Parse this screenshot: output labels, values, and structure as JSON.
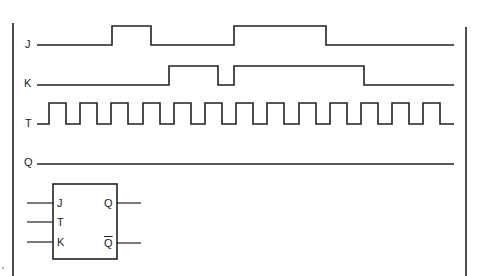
{
  "diagram": {
    "title": "",
    "colors": {
      "stroke": "#222222",
      "background": "#ffffff"
    },
    "signals": [
      {
        "name": "J",
        "label": "J",
        "label_y": 44
      },
      {
        "name": "K",
        "label": "K",
        "label_y": 83
      },
      {
        "name": "T",
        "label": "T",
        "label_y": 123
      },
      {
        "name": "Q",
        "label": "Q",
        "label_y": 162
      }
    ],
    "waveforms": {
      "J": {
        "low_y": 45,
        "high_y": 26,
        "pulses": [
          [
            112,
            151
          ],
          [
            234,
            326
          ]
        ],
        "x_start": 37,
        "x_end": 454
      },
      "K": {
        "low_y": 85,
        "high_y": 66,
        "pulses": [
          [
            169,
            218
          ],
          [
            234,
            364
          ]
        ],
        "x_start": 37,
        "x_end": 454
      },
      "T": {
        "low_y": 124,
        "high_y": 103,
        "first_rise": 49,
        "period": 31.2,
        "high_width": 17,
        "count": 13,
        "x_start": 37,
        "x_end": 454
      },
      "Q": {
        "y": 164,
        "x_start": 37,
        "x_end": 454
      }
    },
    "flipflop": {
      "inputs": [
        {
          "name": "J",
          "label": "J",
          "y": 203
        },
        {
          "name": "T",
          "label": "T",
          "y": 222
        },
        {
          "name": "K",
          "label": "K",
          "y": 242
        }
      ],
      "outputs": [
        {
          "name": "Q",
          "label": "Q",
          "y": 203,
          "inverted": false
        },
        {
          "name": "Q-bar",
          "label": "Q",
          "y": 243,
          "inverted": true
        }
      ]
    }
  }
}
